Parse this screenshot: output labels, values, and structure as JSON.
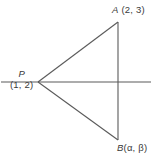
{
  "figure": {
    "type": "geometry-diagram",
    "background_color": "#ffffff",
    "stroke_color": "#5a5a5a",
    "text_color": "#3a3a3a",
    "points": {
      "P": {
        "name": "P",
        "coords": "(1, 2)",
        "x": 38,
        "y": 82
      },
      "A": {
        "name": "A",
        "coords": " (2, 3)",
        "x": 118,
        "y": 22
      },
      "B": {
        "name": "B",
        "coords": "(α, β)",
        "x": 118,
        "y": 140
      }
    },
    "segments": [
      {
        "name": "segment-pa",
        "from": "P",
        "to": "A"
      },
      {
        "name": "segment-pb",
        "from": "P",
        "to": "B"
      },
      {
        "name": "segment-ab",
        "from": "A",
        "to": "B"
      }
    ],
    "axis": {
      "name": "horizontal-axis",
      "y": 82,
      "x_start": 1,
      "x_end": 151
    }
  }
}
